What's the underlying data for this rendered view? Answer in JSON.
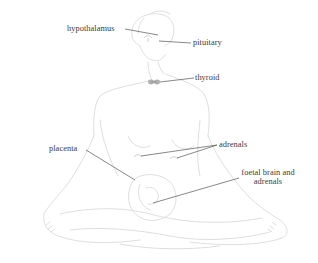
{
  "diagram": {
    "type": "anatomical-illustration",
    "labels": {
      "hypothalamus": "hypothalamus",
      "pituitary": "pituitary",
      "thyroid": "thyroid",
      "adrenals": "adrenals",
      "placenta": "placenta",
      "foetal_line1": "foetal brain and",
      "foetal_line2": "adrenals"
    },
    "colors": {
      "outline": "#d4d4d4",
      "leader": "#555555",
      "text": "#3a3a3a",
      "gland": "#a9a9a9"
    }
  }
}
